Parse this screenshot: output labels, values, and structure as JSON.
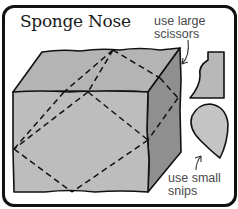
{
  "title": "Sponge Nose",
  "annotations": {
    "large": {
      "line1": "use large",
      "line2": "scissors"
    },
    "small": {
      "line1": "use small",
      "line2": "snips"
    }
  },
  "illustration": {
    "subject": "sponge block with dashed cut lines",
    "faces": {
      "front_color": "#bdbdbd",
      "top_color": "#b2b2b2",
      "right_color": "#8f8f8f"
    },
    "pieces": [
      {
        "name": "large-cut-piece",
        "color": "#b8b8b8"
      },
      {
        "name": "small-teardrop-piece",
        "color": "#c4c4c4"
      }
    ],
    "outline_color": "#111111",
    "cut_line_style": "dashed"
  }
}
